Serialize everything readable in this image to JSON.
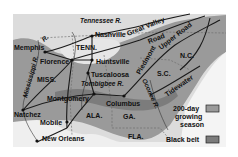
{
  "map": {
    "colors": {
      "background": "#ffffff",
      "land_light": "#dcdcdc",
      "growing_season": "#9a9a9a",
      "black_belt": "#7c7c7c",
      "water": "#f2f2f2",
      "lines": "#1a1a1a",
      "state_border": "#666666"
    },
    "cities": [
      {
        "name": "Memphis"
      },
      {
        "name": "Nashville"
      },
      {
        "name": "Florence"
      },
      {
        "name": "Huntsville"
      },
      {
        "name": "Tuscaloosa"
      },
      {
        "name": "Montgomery"
      },
      {
        "name": "Columbus"
      },
      {
        "name": "Natchez"
      },
      {
        "name": "Mobile"
      },
      {
        "name": "New Orleans"
      }
    ],
    "states": [
      "TENN.",
      "MISS.",
      "ALA.",
      "GA.",
      "FLA.",
      "S.C.",
      "N.C."
    ],
    "rivers": [
      "Tennessee R.",
      "Mississippi R.",
      "Tombigbee R.",
      "Oconee R.",
      "R."
    ],
    "roads": [
      "Great Valley",
      "Road",
      "Piedmont",
      "Upper Road",
      "Tidewater"
    ],
    "legend": {
      "items": [
        {
          "label_line1": "200-day",
          "label_line2": "growing",
          "label_line3": "season",
          "color": "#9a9a9a"
        },
        {
          "label": "Black belt",
          "color": "#7c7c7c"
        }
      ]
    }
  }
}
